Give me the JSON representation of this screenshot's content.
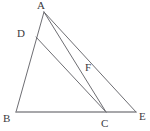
{
  "figure": {
    "width": 150,
    "height": 131,
    "background_color": "#ffffff",
    "line_color": "#6e6e73",
    "baseline_color": "#8a8a8f",
    "label_color": "#3a3a3e",
    "points": [
      {
        "id": "A",
        "label": "A",
        "x": 44,
        "y": 12,
        "label_x": 37,
        "label_y": 0
      },
      {
        "id": "D",
        "label": "D",
        "x": 36,
        "y": 37,
        "label_x": 17,
        "label_y": 28
      },
      {
        "id": "F",
        "label": "F",
        "x": 88,
        "y": 77,
        "label_x": 85,
        "label_y": 62
      },
      {
        "id": "B",
        "label": "B",
        "x": 16,
        "y": 112,
        "label_x": 3,
        "label_y": 113
      },
      {
        "id": "C",
        "label": "C",
        "x": 106,
        "y": 112,
        "label_x": 101,
        "label_y": 118
      },
      {
        "id": "E",
        "label": "E",
        "x": 136,
        "y": 112,
        "label_x": 139,
        "label_y": 111
      }
    ],
    "segments": [
      {
        "id": "AB",
        "from": "A",
        "to": "B",
        "style": "plain"
      },
      {
        "id": "BE",
        "from": "B",
        "to": "E",
        "style": "baseline"
      },
      {
        "id": "AE",
        "from": "A",
        "to": "E",
        "style": "plain"
      },
      {
        "id": "AC",
        "from": "A",
        "to": "C",
        "style": "plain"
      },
      {
        "id": "DC",
        "from": "D",
        "to": "C",
        "style": "plain"
      }
    ]
  }
}
